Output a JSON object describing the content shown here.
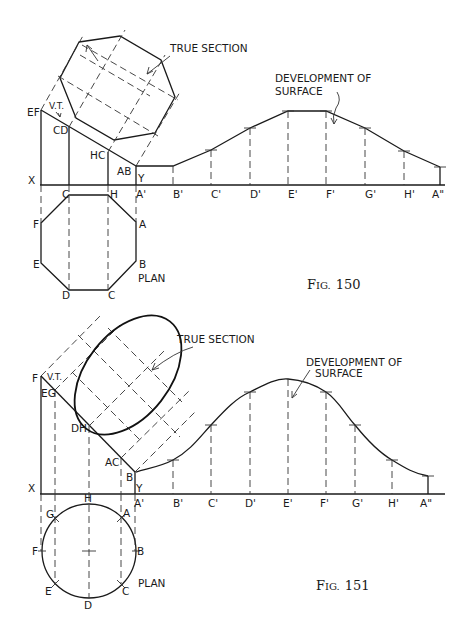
{
  "fig150": {
    "caption": {
      "prefix": "F",
      "smallcaps": "IG.",
      "number": "150"
    },
    "labels": {
      "true_section": "TRUE SECTION",
      "development_line1": "DEVELOPMENT OF",
      "development_line2": "SURFACE",
      "vt": "V.T.",
      "plan": "PLAN",
      "x": "X",
      "y": "Y"
    },
    "elevation_points": [
      "EF",
      "CD",
      "HC",
      "AB"
    ],
    "xy_points": [
      "C",
      "H",
      "A'",
      "B'",
      "C'",
      "D'",
      "E'",
      "F'",
      "G'",
      "H'",
      "A\""
    ],
    "plan_points": [
      "C",
      "H",
      "A",
      "B",
      "C",
      "D",
      "E",
      "F"
    ]
  },
  "fig151": {
    "caption": {
      "prefix": "F",
      "smallcaps": "IG.",
      "number": "151"
    },
    "labels": {
      "true_section": "TRUE SECTION",
      "development_line1": "DEVELOPMENT OF",
      "development_line2": "SURFACE",
      "vt": "V.T.",
      "plan": "PLAN",
      "x": "X",
      "y": "Y"
    },
    "elevation_points": [
      "F",
      "EG",
      "DH",
      "AC",
      "B"
    ],
    "xy_points": [
      "H",
      "A'",
      "B'",
      "C'",
      "D'",
      "E'",
      "F'",
      "G'",
      "H'",
      "A\""
    ],
    "plan_points": [
      "G",
      "A",
      "F",
      "B",
      "E",
      "C",
      "D"
    ]
  }
}
